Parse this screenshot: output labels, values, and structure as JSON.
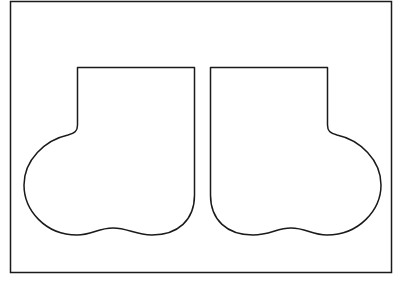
{
  "diagram": {
    "title": "",
    "shapes": [
      {
        "name": "left-boot-outline",
        "orientation": "toe-left"
      },
      {
        "name": "right-boot-outline",
        "orientation": "toe-right"
      }
    ],
    "stroke_color": "#1a1a1a",
    "background_color": "#ffffff"
  }
}
